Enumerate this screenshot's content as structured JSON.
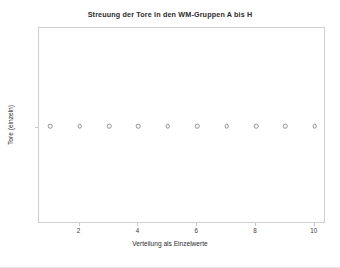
{
  "chart_data": {
    "type": "scatter",
    "title": "Streuung der Tore in den WM-Gruppen A bis H",
    "xlabel": "Verteilung als Einzelwerte",
    "ylabel": "Tore (einzeln)",
    "grid": false,
    "legend": false,
    "xlim": [
      0.62,
      10.38
    ],
    "ylim": [
      0,
      2
    ],
    "xticks": [
      2,
      4,
      6,
      8,
      10
    ],
    "xticklabels": [
      "2",
      "4",
      "6",
      "8",
      "10"
    ],
    "yticks": [],
    "yticklabels": [],
    "marker": "open-circle",
    "marker_color": "#8f8f8f",
    "series": [
      {
        "name": "Tore (einzeln)",
        "x": [
          1,
          2,
          3,
          4,
          5,
          6,
          7,
          8,
          9,
          10
        ],
        "y": [
          1,
          1,
          1,
          1,
          1,
          1,
          1,
          1,
          1,
          1
        ]
      }
    ]
  },
  "figure": {
    "background_color": "#ffffff",
    "frame_color": "#cfcfcf",
    "text_color": "#2b2b2b"
  }
}
